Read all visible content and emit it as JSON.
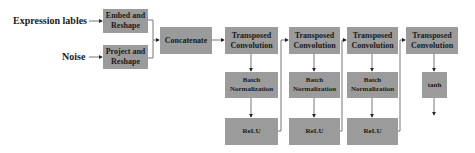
{
  "inputs": {
    "expression_labels": "Expression lables",
    "noise": "Noise"
  },
  "blocks": {
    "embed_reshape": "Embed and Reshape",
    "project_reshape": "Project and Reshape",
    "concatenate": "Concatenate",
    "transposed_conv": [
      "Transposed Convolution",
      "Transposed Convolution",
      "Transposed Convolution",
      "Transposed Convolution"
    ],
    "batch_norm": [
      "Batch Normalization",
      "Batch Normalization",
      "Batch Normalization"
    ],
    "relu": [
      "ReLU",
      "ReLU",
      "ReLU"
    ],
    "tanh": "tanh"
  },
  "colors": {
    "box_fill": "#9b9b9b",
    "text": "#1a1a1a",
    "line": "#444444"
  }
}
